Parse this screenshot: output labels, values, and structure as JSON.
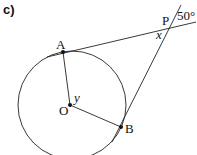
{
  "part_label": "c)",
  "points": {
    "A": "A",
    "O": "O",
    "B": "B",
    "P": "P"
  },
  "angles": {
    "external": "50°",
    "x": "x",
    "y": "y"
  },
  "colors": {
    "stroke": "#222222",
    "background": "#ffffff"
  }
}
